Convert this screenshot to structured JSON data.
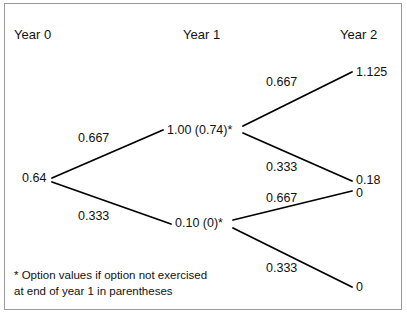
{
  "figure": {
    "type": "binomial-tree-diagram",
    "headers": [
      {
        "label": "Year 0",
        "x": 14,
        "y": 28
      },
      {
        "label": "Year 1",
        "x": 183,
        "y": 28
      },
      {
        "label": "Year 2",
        "x": 340,
        "y": 28
      }
    ],
    "nodes": [
      {
        "id": "root",
        "label": "0.64",
        "x": 22,
        "y": 172,
        "align": "left"
      },
      {
        "id": "up",
        "label": "1.00 (0.74)*",
        "x": 167,
        "y": 124,
        "align": "left"
      },
      {
        "id": "down",
        "label": "0.10 (0)*",
        "x": 175,
        "y": 217,
        "align": "left"
      },
      {
        "id": "uu",
        "label": "1.125",
        "x": 356,
        "y": 66,
        "align": "left"
      },
      {
        "id": "ud",
        "label": "0.18",
        "x": 356,
        "y": 174,
        "align": "left"
      },
      {
        "id": "du",
        "label": "0",
        "x": 356,
        "y": 187,
        "align": "left"
      },
      {
        "id": "dd",
        "label": "0",
        "x": 356,
        "y": 281,
        "align": "left"
      }
    ],
    "edges": [
      {
        "from": "root",
        "to": "up",
        "x1": 52,
        "y1": 178,
        "x2": 163,
        "y2": 130,
        "label": "0.667",
        "lx": 78,
        "ly": 132
      },
      {
        "from": "root",
        "to": "down",
        "x1": 52,
        "y1": 182,
        "x2": 171,
        "y2": 224,
        "label": "0.333",
        "lx": 78,
        "ly": 210
      },
      {
        "from": "up",
        "to": "uu",
        "x1": 243,
        "y1": 126,
        "x2": 352,
        "y2": 72,
        "label": "0.667",
        "lx": 266,
        "ly": 76
      },
      {
        "from": "up",
        "to": "ud",
        "x1": 243,
        "y1": 133,
        "x2": 352,
        "y2": 181,
        "label": "0.333",
        "lx": 266,
        "ly": 161
      },
      {
        "from": "down",
        "to": "du",
        "x1": 233,
        "y1": 220,
        "x2": 352,
        "y2": 191,
        "label": "0.667",
        "lx": 266,
        "ly": 192
      },
      {
        "from": "down",
        "to": "dd",
        "x1": 233,
        "y1": 228,
        "x2": 352,
        "y2": 287,
        "label": "0.333",
        "lx": 266,
        "ly": 262
      }
    ],
    "footnote": {
      "text": "* Option values if option not exercised\nat end of year 1 in parentheses",
      "x": 14,
      "y": 268
    },
    "colors": {
      "line": "#000000",
      "text": "#111111",
      "border": "#9a9a9a",
      "background": "#ffffff"
    }
  }
}
